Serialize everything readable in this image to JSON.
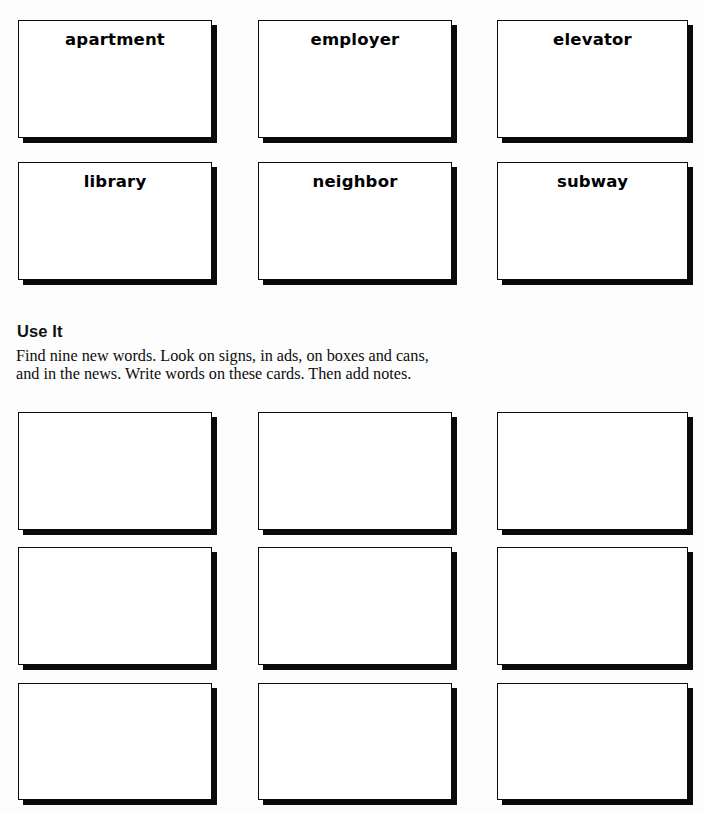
{
  "page": {
    "background_color": "#fdfdfd",
    "ink_color": "#0a0a0a",
    "width": 703,
    "height": 813
  },
  "word_cards": {
    "rows": [
      [
        {
          "word": "apartment",
          "x": 18,
          "y": 20,
          "w": 194,
          "h": 118
        },
        {
          "word": "employer",
          "x": 258,
          "y": 20,
          "w": 194,
          "h": 118
        },
        {
          "word": "elevator",
          "x": 497,
          "y": 20,
          "w": 191,
          "h": 118
        }
      ],
      [
        {
          "word": "library",
          "x": 18,
          "y": 162,
          "w": 194,
          "h": 118
        },
        {
          "word": "neighbor",
          "x": 258,
          "y": 162,
          "w": 194,
          "h": 118
        },
        {
          "word": "subway",
          "x": 497,
          "y": 162,
          "w": 191,
          "h": 118
        }
      ]
    ]
  },
  "use_it_section": {
    "heading": "Use It",
    "body_lines": [
      "Find nine new words. Look on signs, in ads, on boxes and cans,",
      "and in the news. Write words on these cards. Then add notes."
    ]
  },
  "blank_cards": {
    "count": 9,
    "rows": [
      [
        {
          "x": 18,
          "y": 412,
          "w": 194,
          "h": 118
        },
        {
          "x": 258,
          "y": 412,
          "w": 194,
          "h": 118
        },
        {
          "x": 497,
          "y": 412,
          "w": 191,
          "h": 118
        }
      ],
      [
        {
          "x": 18,
          "y": 547,
          "w": 194,
          "h": 118
        },
        {
          "x": 258,
          "y": 547,
          "w": 194,
          "h": 118
        },
        {
          "x": 497,
          "y": 547,
          "w": 191,
          "h": 118
        }
      ],
      [
        {
          "x": 18,
          "y": 683,
          "w": 194,
          "h": 117
        },
        {
          "x": 258,
          "y": 683,
          "w": 194,
          "h": 117
        },
        {
          "x": 497,
          "y": 683,
          "w": 191,
          "h": 117
        }
      ]
    ]
  }
}
